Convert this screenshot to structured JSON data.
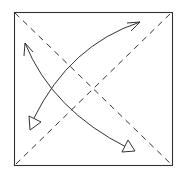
{
  "diagram": {
    "type": "origami-fold-diagram",
    "description": "Square with two dashed diagonal valley-fold creases and two fold-and-unfold arrows",
    "colors": {
      "line": "#333333",
      "background": "#ffffff"
    },
    "square": {
      "x": 14,
      "y": 12,
      "width": 159,
      "height": 154
    },
    "creases": [
      {
        "name": "diagonal-tl-br",
        "style": "dashed",
        "from": [
          15,
          13
        ],
        "to": [
          172,
          165
        ]
      },
      {
        "name": "diagonal-bl-tr",
        "style": "dashed",
        "from": [
          16,
          164
        ],
        "to": [
          172,
          12
        ]
      }
    ],
    "arrows": [
      {
        "name": "fold-arrow-tl-to-br",
        "start": [
          25,
          43
        ],
        "control": [
          62,
          118
        ],
        "end": [
          128,
          148
        ],
        "start_head": "open",
        "end_head": "hollow-triangle"
      },
      {
        "name": "fold-arrow-tr-to-bl",
        "start": [
          140,
          22
        ],
        "control": [
          68,
          48
        ],
        "end": [
          33,
          122
        ],
        "start_head": "open",
        "end_head": "hollow-triangle"
      }
    ],
    "label": ""
  }
}
